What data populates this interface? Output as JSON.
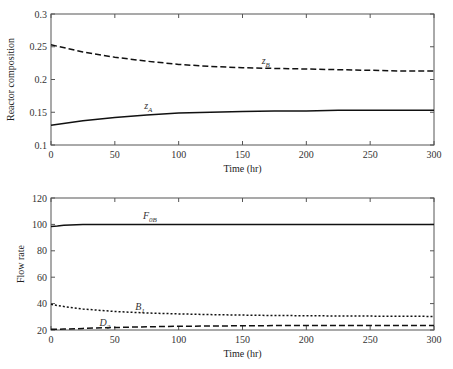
{
  "chart_data": [
    {
      "type": "line",
      "title": "",
      "xlabel": "Time (hr)",
      "ylabel": "Reactor composition",
      "xlim": [
        0,
        300
      ],
      "ylim": [
        0.1,
        0.3
      ],
      "xticks": [
        "0",
        "50",
        "100",
        "150",
        "200",
        "250",
        "300"
      ],
      "yticks": [
        "0.1",
        "0.15",
        "0.2",
        "0.25",
        "0.3"
      ],
      "xtick_values": [
        0,
        50,
        100,
        150,
        200,
        250,
        300
      ],
      "ytick_values": [
        0.1,
        0.15,
        0.2,
        0.25,
        0.3
      ],
      "grid": false,
      "x": [
        0,
        25,
        50,
        75,
        100,
        125,
        150,
        175,
        200,
        225,
        250,
        275,
        300
      ],
      "series": [
        {
          "name": "zB",
          "label_main": "z",
          "label_sub": "B",
          "style": "dashed",
          "values": [
            0.253,
            0.242,
            0.234,
            0.228,
            0.223,
            0.22,
            0.218,
            0.217,
            0.216,
            0.215,
            0.214,
            0.213,
            0.213
          ],
          "label_at": [
            165,
            0.223
          ]
        },
        {
          "name": "zA",
          "label_main": "z",
          "label_sub": "A",
          "style": "solid",
          "values": [
            0.13,
            0.137,
            0.142,
            0.146,
            0.149,
            0.15,
            0.151,
            0.152,
            0.152,
            0.153,
            0.153,
            0.153,
            0.153
          ],
          "label_at": [
            73,
            0.155
          ]
        }
      ]
    },
    {
      "type": "line",
      "title": "",
      "xlabel": "Time (hr)",
      "ylabel": "Flow rate",
      "xlim": [
        0,
        300
      ],
      "ylim": [
        20,
        120
      ],
      "xticks": [
        "0",
        "50",
        "100",
        "150",
        "200",
        "250",
        "300"
      ],
      "yticks": [
        "20",
        "40",
        "60",
        "80",
        "100",
        "120"
      ],
      "xtick_values": [
        0,
        50,
        100,
        150,
        200,
        250,
        300
      ],
      "ytick_values": [
        20,
        40,
        60,
        80,
        100,
        120
      ],
      "grid": false,
      "x": [
        0,
        5,
        10,
        20,
        25,
        50,
        75,
        100,
        125,
        150,
        175,
        200,
        225,
        250,
        275,
        300
      ],
      "series": [
        {
          "name": "F0B",
          "label_main": "F",
          "label_sub": "0B",
          "style": "solid",
          "values": [
            98.5,
            98.8,
            99.3,
            99.8,
            100,
            100,
            100,
            100,
            100,
            100,
            100,
            100,
            100,
            100,
            100,
            100
          ],
          "label_at": [
            72,
            104
          ]
        },
        {
          "name": "B1",
          "label_main": "B",
          "label_sub": "1",
          "style": "dotted",
          "values": [
            39.5,
            38.5,
            37.8,
            36.5,
            35.9,
            34.0,
            32.9,
            32.2,
            31.7,
            31.3,
            31.0,
            30.8,
            30.6,
            30.5,
            30.4,
            30.3
          ],
          "label_at": [
            66,
            35
          ]
        },
        {
          "name": "D2",
          "label_main": "D",
          "label_sub": "2",
          "style": "dashed",
          "values": [
            20.5,
            20.6,
            20.7,
            21.0,
            21.2,
            21.9,
            22.4,
            22.8,
            23.0,
            23.2,
            23.3,
            23.4,
            23.4,
            23.5,
            23.5,
            23.5
          ],
          "label_at": [
            38,
            23.2
          ]
        }
      ]
    }
  ]
}
